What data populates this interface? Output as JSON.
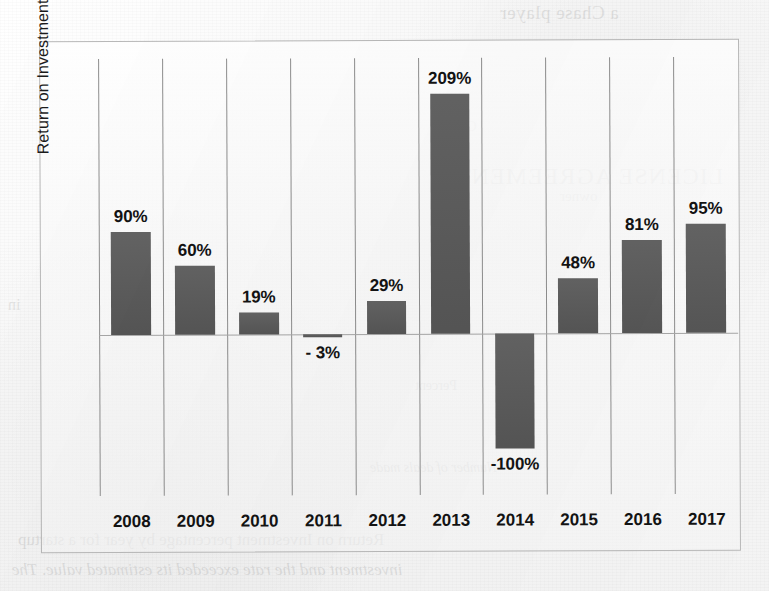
{
  "chart_data": {
    "type": "bar",
    "title": "",
    "xlabel": "",
    "ylabel": "Return on Investment",
    "categories": [
      "2008",
      "2009",
      "2010",
      "2011",
      "2012",
      "2013",
      "2014",
      "2015",
      "2016",
      "2017"
    ],
    "values": [
      90,
      60,
      19,
      -3,
      29,
      209,
      -100,
      48,
      81,
      95
    ],
    "data_labels": [
      "90%",
      "60%",
      "19%",
      "- 3%",
      "29%",
      "209%",
      "-100%",
      "48%",
      "81%",
      "95%"
    ],
    "ylim": [
      -140,
      240
    ],
    "grid": "vertical-category-separators",
    "legend": "none",
    "bar_color": "#5b5b5b",
    "zero_line_color": "#a7a7a7",
    "gridline_color": "#8e8e8e",
    "frame_color": "#b9b9b9",
    "label_color": "#141414"
  },
  "bleed_through": {
    "top_right": "a Chase player",
    "mid_a": "Chase",
    "mid_b": "LICENSE AGREEMENT",
    "mid_c": "owner",
    "mid_d": "Percent",
    "mid_e": "Number of deals made",
    "bot_a": "Return on Investment percentage by year for a startup",
    "bot_b": "investment and the rate exceeded its estimated value. The",
    "left_a": "in"
  }
}
